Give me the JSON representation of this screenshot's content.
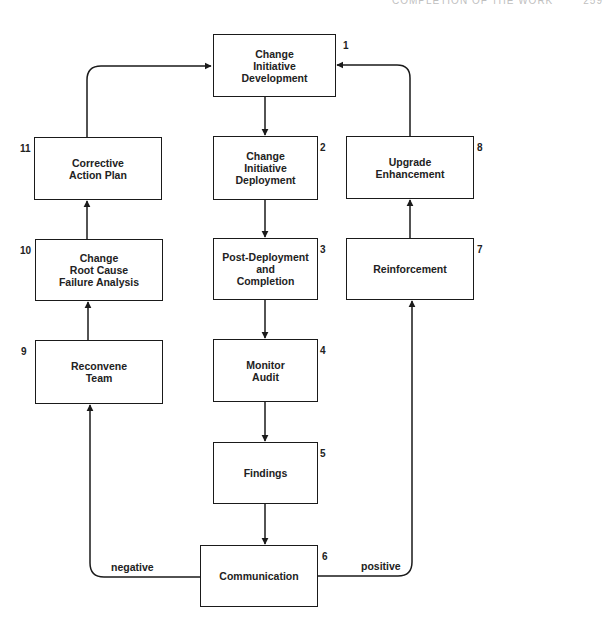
{
  "running_head": {
    "text": "COMPLETION OF THE WORK",
    "page": "259"
  },
  "nodes": [
    {
      "id": 1,
      "number": "1",
      "label": "Change\nInitiative\nDevelopment"
    },
    {
      "id": 2,
      "number": "2",
      "label": "Change\nInitiative\nDeployment"
    },
    {
      "id": 3,
      "number": "3",
      "label": "Post-Deployment\nand\nCompletion"
    },
    {
      "id": 4,
      "number": "4",
      "label": "Monitor\nAudit"
    },
    {
      "id": 5,
      "number": "5",
      "label": "Findings"
    },
    {
      "id": 6,
      "number": "6",
      "label": "Communication"
    },
    {
      "id": 7,
      "number": "7",
      "label": "Reinforcement"
    },
    {
      "id": 8,
      "number": "8",
      "label": "Upgrade\nEnhancement"
    },
    {
      "id": 9,
      "number": "9",
      "label": "Reconvene\nTeam"
    },
    {
      "id": 10,
      "number": "10",
      "label": "Change\nRoot Cause\nFailure Analysis"
    },
    {
      "id": 11,
      "number": "11",
      "label": "Corrective\nAction Plan"
    }
  ],
  "edges": [
    {
      "from": 1,
      "to": 2
    },
    {
      "from": 2,
      "to": 3
    },
    {
      "from": 3,
      "to": 4
    },
    {
      "from": 4,
      "to": 5
    },
    {
      "from": 5,
      "to": 6
    },
    {
      "from": 6,
      "to": 7,
      "label": "positive"
    },
    {
      "from": 7,
      "to": 8
    },
    {
      "from": 8,
      "to": 1
    },
    {
      "from": 6,
      "to": 9,
      "label": "negative"
    },
    {
      "from": 9,
      "to": 10
    },
    {
      "from": 10,
      "to": 11
    },
    {
      "from": 11,
      "to": 1
    }
  ],
  "edge_labels": {
    "positive": "positive",
    "negative": "negative"
  },
  "colors": {
    "line": "#1a1a1a",
    "background": "#ffffff"
  }
}
